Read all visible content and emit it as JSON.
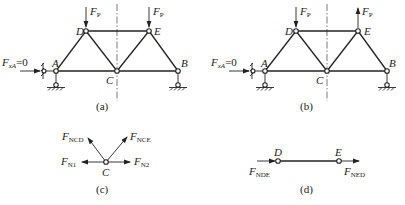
{
  "panels": {
    "a": {
      "caption": "(a)",
      "support_force": {
        "symbol": "F",
        "subscript": "xA",
        "value": "=0"
      },
      "loads": [
        {
          "node": "D",
          "symbol": "F",
          "subscript": "P",
          "direction": "down"
        },
        {
          "node": "E",
          "symbol": "F",
          "subscript": "P",
          "direction": "down"
        }
      ],
      "nodes": {
        "A": "A",
        "B": "B",
        "C": "C",
        "D": "D",
        "E": "E"
      }
    },
    "b": {
      "caption": "(b)",
      "support_force": {
        "symbol": "F",
        "subscript": "xA",
        "value": "=0"
      },
      "loads": [
        {
          "node": "D",
          "symbol": "F",
          "subscript": "P",
          "direction": "down"
        },
        {
          "node": "E",
          "symbol": "F",
          "subscript": "P",
          "direction": "up"
        }
      ],
      "nodes": {
        "A": "A",
        "B": "B",
        "C": "C",
        "D": "D",
        "E": "E"
      }
    },
    "c": {
      "caption": "(c)",
      "node": "C",
      "forces": [
        {
          "symbol": "F",
          "subscript": "NCD",
          "direction": "up-left"
        },
        {
          "symbol": "F",
          "subscript": "NCE",
          "direction": "up-right"
        },
        {
          "symbol": "F",
          "subscript": "N1",
          "direction": "left"
        },
        {
          "symbol": "F",
          "subscript": "N2",
          "direction": "right"
        }
      ]
    },
    "d": {
      "caption": "(d)",
      "nodes": {
        "D": "D",
        "E": "E"
      },
      "forces": [
        {
          "symbol": "F",
          "subscript": "NDE",
          "direction": "right-into-D"
        },
        {
          "symbol": "F",
          "subscript": "NED",
          "direction": "right-out-of-E"
        }
      ]
    }
  }
}
